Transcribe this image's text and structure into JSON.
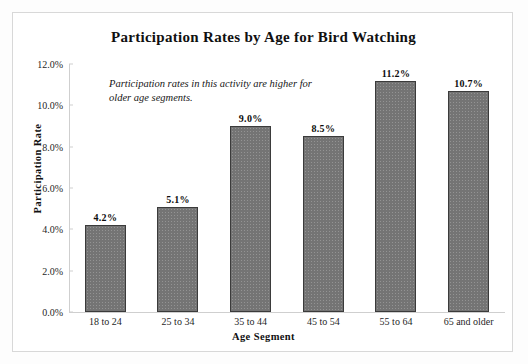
{
  "chart_data": {
    "type": "bar",
    "title": "Participation Rates by Age for Bird Watching",
    "xlabel": "Age Segment",
    "ylabel": "Participation Rate",
    "categories": [
      "18 to 24",
      "25 to 34",
      "35 to 44",
      "45 to 54",
      "55 to 64",
      "65 and older"
    ],
    "values": [
      4.2,
      5.1,
      9.0,
      8.5,
      11.2,
      10.7
    ],
    "value_labels": [
      "4.2%",
      "5.1%",
      "9.0%",
      "8.5%",
      "11.2%",
      "10.7%"
    ],
    "ylim": [
      0,
      12
    ],
    "ytick_step": 2,
    "ytick_labels": [
      "0.0%",
      "2.0%",
      "4.0%",
      "6.0%",
      "8.0%",
      "10.0%",
      "12.0%"
    ],
    "ytick_values": [
      0,
      2,
      4,
      6,
      8,
      10,
      12
    ],
    "grid": false,
    "legend": "none",
    "annotation": "Participation rates in this activity are higher for older age segments.",
    "bar_fill_color": "#747474",
    "bar_edge_color": "#3b3b3b",
    "axis_color": "#cfcfcf",
    "frame_color": "#d8d8d8",
    "background_color": "#ffffff"
  }
}
